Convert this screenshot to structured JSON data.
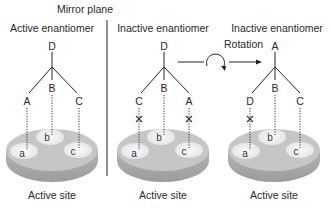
{
  "figure": {
    "mirror_plane_label": "Mirror plane",
    "rotation_label": "Rotation",
    "colors": {
      "ink": "#222222",
      "disc_top": "#c9c9c9",
      "disc_side": "#a9a9a9",
      "site_spot": "#f0f0f0",
      "background": "#ffffff"
    },
    "panels": [
      {
        "title": "Active enantiomer",
        "top": "D",
        "left": "A",
        "middle": "B",
        "right": "C",
        "mismatch_left": false,
        "mismatch_right": false,
        "site_label": "Active site",
        "sites": [
          "a",
          "b",
          "c"
        ]
      },
      {
        "title": "Inactive enantiomer",
        "top": "D",
        "left": "C",
        "middle": "B",
        "right": "A",
        "mismatch_left": true,
        "mismatch_right": true,
        "site_label": "Active site",
        "sites": [
          "a",
          "b",
          "c"
        ]
      },
      {
        "title": "Inactive enantiomer",
        "top": "A",
        "left": "D",
        "middle": "B",
        "right": "C",
        "mismatch_left": true,
        "mismatch_right": false,
        "site_label": "Active site",
        "sites": [
          "a",
          "b",
          "c"
        ]
      }
    ]
  }
}
